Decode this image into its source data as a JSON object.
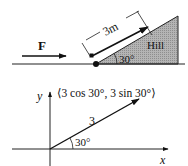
{
  "top_diagram": {
    "force_label": "F",
    "distance_label": "3m",
    "hill_label": "Hill",
    "angle_label": "30°",
    "colors": {
      "hill_fill": "#a9a9a9",
      "line": "#111111"
    }
  },
  "bottom_diagram": {
    "y_axis_label": "y",
    "x_axis_label": "x",
    "vector_label": "⟨3 cos 30°, 3 sin 30°⟩",
    "magnitude_label": "3",
    "angle_label": "30°"
  }
}
